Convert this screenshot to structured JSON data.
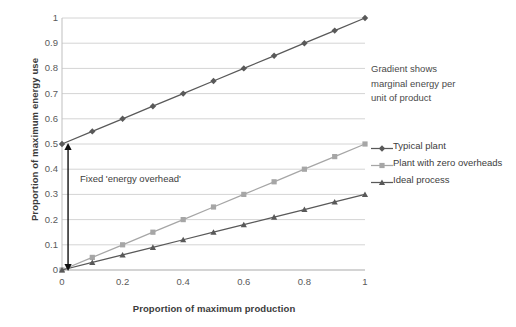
{
  "chart_data": {
    "type": "line",
    "title": "",
    "xlabel": "Proportion of maximum production",
    "ylabel": "Proportion of maximum energy use",
    "xlim": [
      0,
      1
    ],
    "ylim": [
      0,
      1
    ],
    "grid": true,
    "grid_axis": "y",
    "legend_position": "right",
    "x": [
      0,
      0.1,
      0.2,
      0.3,
      0.4,
      0.5,
      0.6,
      0.7,
      0.8,
      0.9,
      1
    ],
    "xticks": [
      "0",
      "0.2",
      "0.4",
      "0.6",
      "0.8",
      "1"
    ],
    "xtick_values": [
      0,
      0.2,
      0.4,
      0.6,
      0.8,
      1
    ],
    "yticks": [
      "0",
      "0.1",
      "0.2",
      "0.3",
      "0.4",
      "0.5",
      "0.6",
      "0.7",
      "0.8",
      "0.9",
      "1"
    ],
    "ytick_values": [
      0,
      0.1,
      0.2,
      0.3,
      0.4,
      0.5,
      0.6,
      0.7,
      0.8,
      0.9,
      1
    ],
    "series": [
      {
        "name": "Typical plant",
        "color": "#595959",
        "marker": "diamond",
        "intercept": 0.5,
        "slope": 0.5,
        "values": [
          0.5,
          0.55,
          0.6,
          0.65,
          0.7,
          0.75,
          0.8,
          0.85,
          0.9,
          0.95,
          1.0
        ]
      },
      {
        "name": "Plant with zero overheads",
        "color": "#a6a6a6",
        "marker": "square",
        "intercept": 0,
        "slope": 0.5,
        "values": [
          0,
          0.05,
          0.1,
          0.15,
          0.2,
          0.25,
          0.3,
          0.35,
          0.4,
          0.45,
          0.5
        ]
      },
      {
        "name": "Ideal process",
        "color": "#595959",
        "marker": "triangle",
        "intercept": 0,
        "slope": 0.3,
        "values": [
          0,
          0.03,
          0.06,
          0.09,
          0.12,
          0.15,
          0.18,
          0.21,
          0.24,
          0.27,
          0.3
        ]
      }
    ],
    "annotations": [
      {
        "name": "gradient-note",
        "text": "Gradient shows marginal energy per unit of product",
        "lines": [
          "Gradient shows",
          "marginal energy per",
          "unit of product"
        ]
      },
      {
        "name": "overhead-note",
        "text": "Fixed 'energy overhead'",
        "arrow": {
          "x": 0.02,
          "y_from": 0,
          "y_to": 0.5,
          "double_headed": true
        }
      }
    ]
  },
  "axes": {
    "y_title": "Proportion of maximum energy use",
    "x_title": "Proportion of maximum production"
  },
  "annotations": {
    "gradient_line1": "Gradient shows",
    "gradient_line2": "marginal energy per",
    "gradient_line3": "unit of product",
    "overhead": "Fixed 'energy overhead'"
  },
  "legend": {
    "items": [
      {
        "label": "Typical plant"
      },
      {
        "label": "Plant with zero overheads"
      },
      {
        "label": "Ideal process"
      }
    ]
  },
  "colors": {
    "dark_series": "#595959",
    "light_series": "#a6a6a6",
    "gridline": "#d4d4d4",
    "axis": "#bfbfbf",
    "text": "#3d3d3d",
    "background": "#ffffff"
  }
}
